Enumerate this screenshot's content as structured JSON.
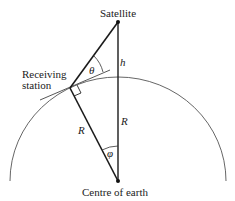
{
  "labels": {
    "satellite": "Satellite",
    "receiving_station_line1": "Receiving",
    "receiving_station_line2": "station",
    "centre": "Centre of earth",
    "height": "h",
    "radius_left": "R",
    "radius_right": "R",
    "angle_theta": "θ",
    "angle_phi": "φ"
  },
  "colors": {
    "line": "#1a1a1a",
    "arc": "#555555"
  }
}
